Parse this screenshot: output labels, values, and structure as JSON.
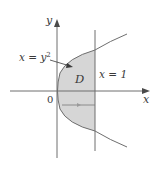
{
  "diagram": {
    "axes": {
      "x_label": "x",
      "y_label": "y",
      "origin_label": "0"
    },
    "curve": {
      "label": "x = y",
      "label_exponent": "2",
      "equation": "x = y^2"
    },
    "line": {
      "label": "x = 1",
      "equation": "x = 1"
    },
    "region": {
      "label": "D",
      "fill": "#d6d6d6"
    },
    "colors": {
      "stroke": "#6e6e6e",
      "text": "#3a3a3a",
      "background": "#ffffff"
    }
  }
}
